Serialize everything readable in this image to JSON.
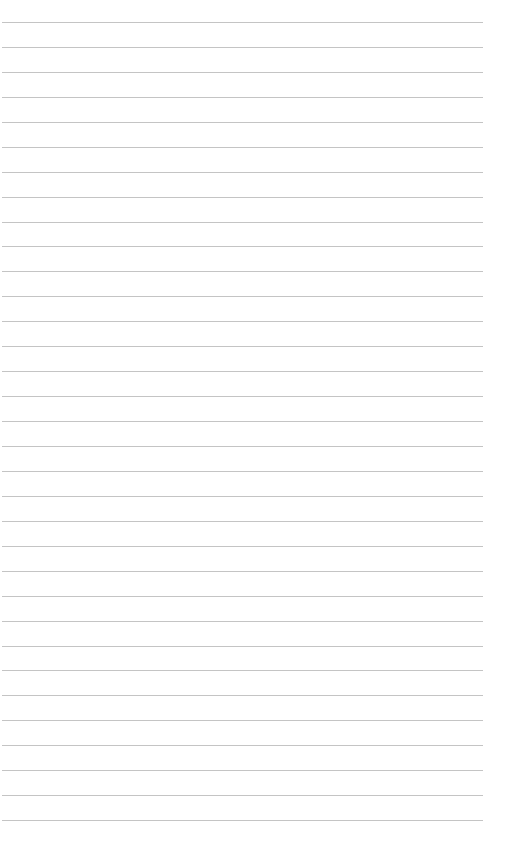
{
  "page": {
    "type": "lined-paper",
    "background_color": "#ffffff",
    "rule_color": "#c4c4c4",
    "rule_count": 33,
    "first_rule_y": 22,
    "rule_spacing": 24.94,
    "rule_left": 2,
    "rule_right": 483
  }
}
